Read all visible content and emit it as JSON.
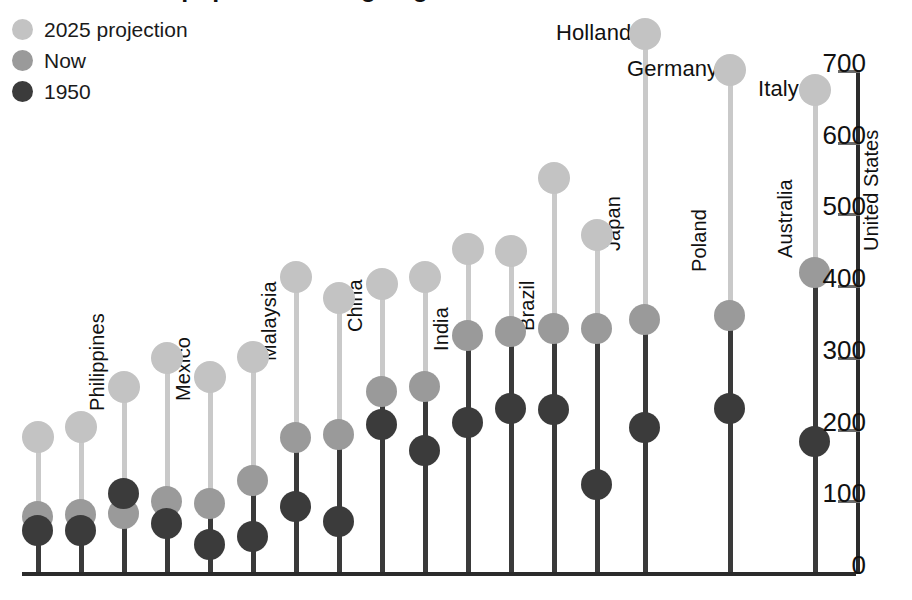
{
  "chart": {
    "title": "The world's population is ageing fast",
    "legend": [
      {
        "key": "proj",
        "label": "2025 projection",
        "color": "#c3c3c3"
      },
      {
        "key": "now",
        "label": "Now",
        "color": "#9a9a9a"
      },
      {
        "key": "old",
        "label": "1950",
        "color": "#3b3b3b"
      }
    ],
    "axis": {
      "position": "right",
      "ticks": [
        "700",
        "600",
        "500",
        "400",
        "300",
        "200",
        "100",
        "0"
      ],
      "min": 0,
      "max": 700,
      "step": 100
    }
  },
  "chart_data": {
    "type": "line",
    "title": "The world's population is ageing fast",
    "subtitle": "",
    "xlabel": "",
    "ylabel": "",
    "ylim": [
      0,
      700
    ],
    "grid": false,
    "legend_position": "top-left",
    "categories": [
      "Philippines",
      "Mexico",
      "Malaysia",
      "China",
      "India",
      "Brazil",
      "Japan",
      "Poland",
      "Australia",
      "United States",
      "Norway",
      "Britain",
      "France",
      "Hungary",
      "Holland",
      "Germany",
      "Italy"
    ],
    "series": [
      {
        "name": "2025 projection",
        "color": "#c3c3c3",
        "values": [
          188,
          202,
          258,
          298,
          272,
          300,
          412,
          382,
          402,
          412,
          450,
          448,
          550,
          470,
          750,
          700,
          672
        ]
      },
      {
        "name": "Now",
        "color": "#9a9a9a",
        "values": [
          78,
          80,
          82,
          98,
          96,
          128,
          188,
          192,
          252,
          258,
          330,
          335,
          340,
          340,
          352,
          358,
          418
        ]
      },
      {
        "name": "1950",
        "color": "#3b3b3b",
        "values": [
          58,
          58,
          110,
          68,
          38,
          50,
          92,
          70,
          205,
          170,
          208,
          228,
          226,
          122,
          202,
          228,
          182
        ]
      }
    ]
  },
  "columns": [
    {
      "label": "Philippines",
      "x": 38,
      "proj": 188,
      "now": 78,
      "old": 58,
      "label_mode": "rot"
    },
    {
      "label": "Mexico",
      "x": 81,
      "proj": 202,
      "now": 80,
      "old": 58,
      "label_mode": "rot"
    },
    {
      "label": "Malaysia",
      "x": 124,
      "proj": 258,
      "now": 82,
      "old": 110,
      "label_mode": "rot"
    },
    {
      "label": "China",
      "x": 167,
      "proj": 298,
      "now": 98,
      "old": 68,
      "label_mode": "rot"
    },
    {
      "label": "India",
      "x": 210,
      "proj": 272,
      "now": 96,
      "old": 38,
      "label_mode": "rot"
    },
    {
      "label": "Brazil",
      "x": 253,
      "proj": 300,
      "now": 128,
      "old": 50,
      "label_mode": "rot"
    },
    {
      "label": "Japan",
      "x": 296,
      "proj": 412,
      "now": 188,
      "old": 92,
      "label_mode": "rot"
    },
    {
      "label": "Poland",
      "x": 339,
      "proj": 382,
      "now": 192,
      "old": 70,
      "label_mode": "rot"
    },
    {
      "label": "Australia",
      "x": 382,
      "proj": 402,
      "now": 252,
      "old": 205,
      "label_mode": "rot"
    },
    {
      "label": "United States",
      "x": 425,
      "proj": 412,
      "now": 258,
      "old": 170,
      "label_mode": "rot"
    },
    {
      "label": "Norway",
      "x": 468,
      "proj": 450,
      "now": 330,
      "old": 208,
      "label_mode": "rot"
    },
    {
      "label": "Britain",
      "x": 511,
      "proj": 448,
      "now": 335,
      "old": 228,
      "label_mode": "rot"
    },
    {
      "label": "France",
      "x": 554,
      "proj": 550,
      "now": 340,
      "old": 226,
      "label_mode": "rot"
    },
    {
      "label": "Hungary",
      "x": 597,
      "proj": 470,
      "now": 340,
      "old": 122,
      "label_mode": "rot"
    },
    {
      "label": "Holland",
      "x": 645,
      "proj": 750,
      "now": 352,
      "old": 202,
      "label_mode": "horiz"
    },
    {
      "label": "Germany",
      "x": 730,
      "proj": 700,
      "now": 358,
      "old": 228,
      "label_mode": "horiz"
    },
    {
      "label": "Italy",
      "x": 815,
      "proj": 672,
      "now": 418,
      "old": 182,
      "label_mode": "horiz"
    }
  ]
}
